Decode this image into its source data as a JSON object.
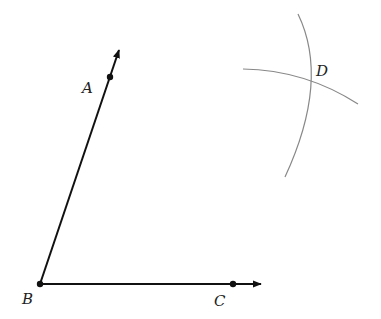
{
  "diagram": {
    "points": {
      "A": {
        "label": "A",
        "x": 110,
        "y": 77
      },
      "B": {
        "label": "B",
        "x": 40,
        "y": 284
      },
      "C": {
        "label": "C",
        "x": 233,
        "y": 284
      },
      "D": {
        "label": "D",
        "x": 312,
        "y": 80
      }
    },
    "rays": [
      {
        "name": "ray-BA",
        "from": "B",
        "through": "A"
      },
      {
        "name": "ray-BC",
        "from": "B",
        "through": "C"
      }
    ],
    "arcs": [
      {
        "name": "arc-vertical"
      },
      {
        "name": "arc-horizontal"
      }
    ],
    "colors": {
      "ray": "#111111",
      "arc": "#888888",
      "label": "#222222"
    }
  }
}
